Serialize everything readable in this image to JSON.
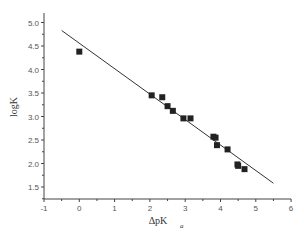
{
  "chart_data": {
    "type": "scatter",
    "title": "",
    "xlabel": "ΔpK",
    "xlabel_subscript": "a",
    "ylabel": "logK",
    "xlim": [
      -1,
      6
    ],
    "ylim": [
      1.3,
      5.2
    ],
    "x_ticks": [
      -1,
      0,
      1,
      2,
      3,
      4,
      5,
      6
    ],
    "x_tick_labels": [
      "-1",
      "0",
      "1",
      "2",
      "3",
      "4",
      "5",
      "6"
    ],
    "y_ticks": [
      1.5,
      2.0,
      2.5,
      3.0,
      3.5,
      4.0,
      4.5,
      5.0
    ],
    "y_tick_labels": [
      "1.5",
      "2.0",
      "2.5",
      "3.0",
      "3.5",
      "4.0",
      "4.5",
      "5.0"
    ],
    "grid": false,
    "legend": null,
    "series": [
      {
        "name": "data",
        "marker": "square",
        "color": "#222222",
        "points": [
          {
            "x": 0.0,
            "y": 4.38
          },
          {
            "x": 2.05,
            "y": 3.45
          },
          {
            "x": 2.35,
            "y": 3.41
          },
          {
            "x": 2.5,
            "y": 3.22
          },
          {
            "x": 2.65,
            "y": 3.12
          },
          {
            "x": 2.95,
            "y": 2.96
          },
          {
            "x": 3.15,
            "y": 2.96
          },
          {
            "x": 3.8,
            "y": 2.57
          },
          {
            "x": 3.86,
            "y": 2.55
          },
          {
            "x": 3.9,
            "y": 2.39
          },
          {
            "x": 4.2,
            "y": 2.3
          },
          {
            "x": 4.48,
            "y": 1.98
          },
          {
            "x": 4.5,
            "y": 1.95
          },
          {
            "x": 4.68,
            "y": 1.88
          }
        ]
      },
      {
        "name": "linear fit",
        "type": "line",
        "color": "#333333",
        "points": [
          {
            "x": -0.5,
            "y": 4.83
          },
          {
            "x": 5.5,
            "y": 1.58
          }
        ]
      }
    ]
  }
}
